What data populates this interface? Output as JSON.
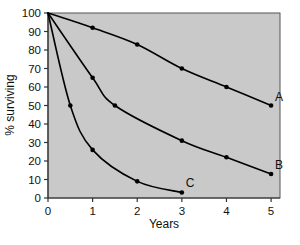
{
  "chart_data": {
    "type": "line",
    "title": "",
    "xlabel": "Years",
    "ylabel": "% surviving",
    "xlim": [
      0,
      5.2
    ],
    "ylim": [
      0,
      100
    ],
    "grid": false,
    "legend_position": "inline-right-end-of-curve",
    "plot_background": "#c9c9c9",
    "line_color": "#000000",
    "marker_color": "#000000",
    "xticks": [
      0,
      1,
      2,
      3,
      4,
      5
    ],
    "xticklabels": [
      "0",
      "1",
      "2",
      "3",
      "4",
      "5"
    ],
    "yticks": [
      0,
      10,
      20,
      30,
      40,
      50,
      60,
      70,
      80,
      90,
      100
    ],
    "yticklabels": [
      "0",
      "10",
      "20",
      "30",
      "40",
      "50",
      "60",
      "70",
      "80",
      "90",
      "100"
    ],
    "series": [
      {
        "name": "A",
        "label": "A",
        "x": [
          0,
          1,
          2,
          3,
          4,
          5
        ],
        "values": [
          100,
          92,
          83,
          70,
          60,
          50
        ]
      },
      {
        "name": "B",
        "label": "B",
        "x": [
          0,
          1,
          1.5,
          3,
          4,
          5
        ],
        "values": [
          100,
          65,
          50,
          31,
          22,
          13
        ]
      },
      {
        "name": "C",
        "label": "C",
        "x": [
          0,
          0.5,
          1,
          2,
          3
        ],
        "values": [
          100,
          50,
          26,
          9,
          3
        ]
      }
    ]
  },
  "axes": {
    "x_title": "Years",
    "y_title": "% surviving"
  },
  "annotations": [
    {
      "name": "series-label-a",
      "text": "A"
    },
    {
      "name": "series-label-b",
      "text": "B"
    },
    {
      "name": "series-label-c",
      "text": "C"
    }
  ]
}
